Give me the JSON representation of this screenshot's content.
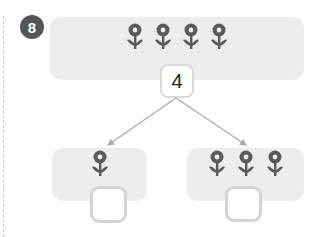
{
  "problem": {
    "number": "8",
    "whole": {
      "flower_count": 4,
      "value": "4"
    },
    "parts": [
      {
        "flower_count": 1,
        "answer": ""
      },
      {
        "flower_count": 3,
        "answer": ""
      }
    ]
  },
  "icons": {
    "flower": "flower-icon"
  },
  "colors": {
    "badge": "#555555",
    "panel": "#ececec",
    "flower": "#5a5a5a",
    "arrow": "#aaaaaa",
    "box_border": "#d3d3d3"
  }
}
